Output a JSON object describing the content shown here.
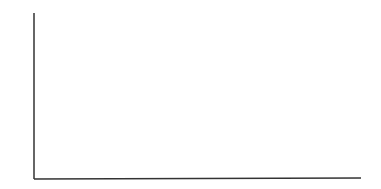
{
  "chart_data": {
    "type": "bar",
    "subtype": "stem",
    "title": "",
    "xlabel": "",
    "ylabel": "Amplitude",
    "categories": [
      "f1",
      "f2",
      "f3"
    ],
    "x_positions_px": [
      119,
      209,
      293
    ],
    "values": [
      0.53,
      0.35,
      0.41
    ],
    "ylim": [
      0,
      1
    ],
    "grid": false,
    "legend": null,
    "tick_labels": false
  },
  "style": {
    "axis_color": "#333333",
    "stem_color": "#222222"
  }
}
